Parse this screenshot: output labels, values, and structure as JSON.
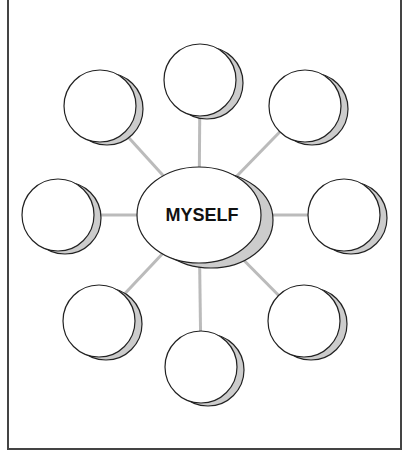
{
  "diagram": {
    "type": "concept-web",
    "center": {
      "label": "MYSELF",
      "cx": 199,
      "cy": 215,
      "rx": 62,
      "ry": 48
    },
    "colors": {
      "stroke": "#222222",
      "shadow": "#cccccc",
      "connector": "#bbbbbb",
      "fill": "#ffffff",
      "frame": "#444444"
    },
    "nodes": [
      {
        "name": "top",
        "cx": 200,
        "cy": 80,
        "label": ""
      },
      {
        "name": "top-left",
        "cx": 100,
        "cy": 106,
        "label": ""
      },
      {
        "name": "top-right",
        "cx": 305,
        "cy": 106,
        "label": ""
      },
      {
        "name": "left",
        "cx": 58,
        "cy": 215,
        "label": ""
      },
      {
        "name": "right",
        "cx": 344,
        "cy": 215,
        "label": ""
      },
      {
        "name": "bottom-left",
        "cx": 99,
        "cy": 321,
        "label": ""
      },
      {
        "name": "bottom-right",
        "cx": 304,
        "cy": 321,
        "label": ""
      },
      {
        "name": "bottom",
        "cx": 201,
        "cy": 367,
        "label": ""
      }
    ]
  }
}
